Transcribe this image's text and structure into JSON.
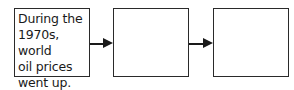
{
  "diagram": {
    "type": "flowchart",
    "direction": "left-to-right",
    "boxes": [
      {
        "id": "box1",
        "text": "During the\n1970s, world\noil prices\nwent up."
      },
      {
        "id": "box2",
        "text": ""
      },
      {
        "id": "box3",
        "text": ""
      }
    ],
    "arrows": [
      {
        "from": "box1",
        "to": "box2"
      },
      {
        "from": "box2",
        "to": "box3"
      }
    ],
    "colors": {
      "stroke": "#2a2a2a",
      "text": "#1a1a1a",
      "background": "#ffffff"
    }
  }
}
